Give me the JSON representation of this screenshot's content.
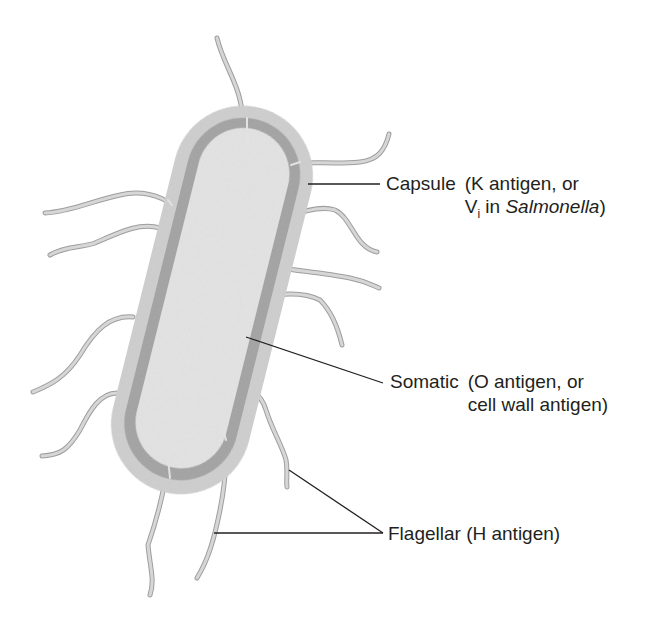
{
  "diagram": {
    "colors": {
      "capsule": "#d2d2d2",
      "cell_wall": "#a8a8a8",
      "cytoplasm": "#e6e6e6",
      "flagellum": "#c4c4c4",
      "leader_line": "#231f20",
      "text": "#231f20"
    },
    "labels": {
      "capsule": {
        "name": "Capsule",
        "detail_line1": "(K antigen, or",
        "detail_line2_prefix": "V",
        "detail_line2_sub": "i",
        "detail_line2_mid": " in ",
        "detail_line2_italic": "Salmonella",
        "detail_line2_suffix": ")"
      },
      "somatic": {
        "name": "Somatic",
        "detail_line1": "(O antigen, or",
        "detail_line2": "cell wall antigen)"
      },
      "flagellar": {
        "name": "Flagellar (H antigen)"
      }
    }
  }
}
